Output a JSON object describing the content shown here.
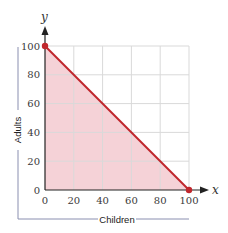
{
  "chart_data": {
    "type": "area",
    "title": "",
    "xlabel": "Children",
    "ylabel": "Adults",
    "x_axis_variable": "x",
    "y_axis_variable": "y",
    "xlim": [
      0,
      100
    ],
    "ylim": [
      0,
      100
    ],
    "x_ticks": [
      "0",
      "20",
      "40",
      "60",
      "80",
      "100"
    ],
    "y_ticks": [
      "0",
      "20",
      "40",
      "60",
      "80",
      "100"
    ],
    "grid": true,
    "legend": null,
    "series": [
      {
        "name": "constraint line",
        "type": "line",
        "points": [
          [
            0,
            100
          ],
          [
            100,
            0
          ]
        ],
        "color": "#c0272d"
      },
      {
        "name": "feasible region",
        "type": "area",
        "points": [
          [
            0,
            0
          ],
          [
            0,
            100
          ],
          [
            100,
            0
          ]
        ],
        "color": "#f4cdd3"
      }
    ],
    "markers": [
      {
        "x": 0,
        "y": 100,
        "color": "#c0272d"
      },
      {
        "x": 100,
        "y": 0,
        "color": "#c0272d"
      }
    ]
  },
  "colors": {
    "line": "#c0272d",
    "fill": "#f4cdd3",
    "grid": "#d9d9d9",
    "axis": "#222222",
    "bracket": "#8a8fb0"
  }
}
